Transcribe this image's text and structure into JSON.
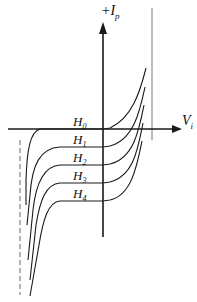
{
  "diagram": {
    "type": "characteristic-curves",
    "y_axis": {
      "label": "+I",
      "subscript": "p"
    },
    "x_axis": {
      "label": "V",
      "subscript": "i"
    },
    "curves": [
      {
        "label": "H",
        "subscript": "0"
      },
      {
        "label": "H",
        "subscript": "1"
      },
      {
        "label": "H",
        "subscript": "2"
      },
      {
        "label": "H",
        "subscript": "3"
      },
      {
        "label": "H",
        "subscript": "4"
      }
    ],
    "reference_lines": [
      {
        "style": "solid",
        "position": "right"
      },
      {
        "style": "dashed",
        "position": "left"
      }
    ],
    "colors": {
      "line": "#1a1a1a",
      "background": "#ffffff"
    }
  }
}
